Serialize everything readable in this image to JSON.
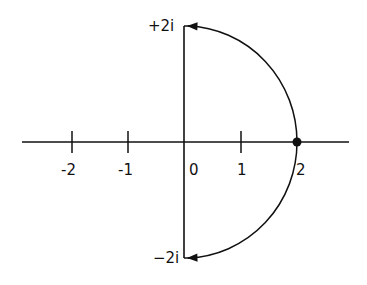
{
  "diagram": {
    "type": "complex-plane-contour",
    "real_axis_ticks": [
      {
        "value": -2,
        "label": "-2"
      },
      {
        "value": -1,
        "label": "-1"
      },
      {
        "value": 0,
        "label": "0"
      },
      {
        "value": 1,
        "label": "1"
      },
      {
        "value": 2,
        "label": "2"
      }
    ],
    "imag_labels": {
      "top": "+2i",
      "bottom": "−2i"
    },
    "marked_point": {
      "re": 2,
      "im": 0
    },
    "contour": "semicircle of radius 2 in right half-plane with arrows toward +2i and -2i",
    "stroke_color": "#111111",
    "background": "#ffffff"
  }
}
